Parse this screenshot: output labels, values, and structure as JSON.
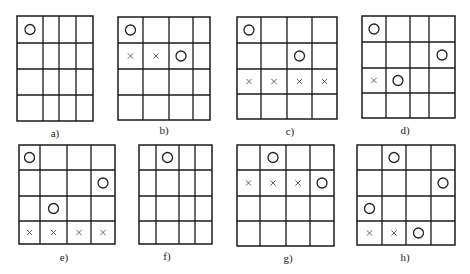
{
  "figure": {
    "background": "#ffffff",
    "line_color": "#1a1a1a",
    "panels": [
      {
        "id": "a",
        "label": "a)",
        "cols": [
          17,
          43,
          59,
          76,
          93
        ],
        "rows": [
          16,
          43,
          69,
          95,
          121
        ],
        "label_pos": [
          55,
          137
        ],
        "marks": [
          {
            "type": "O",
            "row": 0,
            "col": 0
          }
        ]
      },
      {
        "id": "b",
        "label": "b)",
        "cols": [
          118,
          143,
          169,
          193,
          210
        ],
        "rows": [
          17,
          43,
          69,
          95,
          120
        ],
        "label_pos": [
          164,
          134
        ],
        "marks": [
          {
            "type": "O",
            "row": 0,
            "col": 0
          },
          {
            "type": "X",
            "row": 1,
            "col": 0
          },
          {
            "type": "X",
            "row": 1,
            "col": 1
          },
          {
            "type": "O",
            "row": 1,
            "col": 2
          }
        ]
      },
      {
        "id": "c",
        "label": "c)",
        "cols": [
          237,
          261,
          287,
          312,
          337
        ],
        "rows": [
          17,
          43,
          69,
          94,
          119
        ],
        "label_pos": [
          290,
          135
        ],
        "marks": [
          {
            "type": "O",
            "row": 0,
            "col": 0
          },
          {
            "type": "O",
            "row": 1,
            "col": 2
          },
          {
            "type": "X",
            "row": 2,
            "col": 0
          },
          {
            "type": "X",
            "row": 2,
            "col": 1
          },
          {
            "type": "X",
            "row": 2,
            "col": 2
          },
          {
            "type": "X",
            "row": 2,
            "col": 3
          }
        ]
      },
      {
        "id": "d",
        "label": "d)",
        "cols": [
          362,
          386,
          410,
          429,
          455
        ],
        "rows": [
          16,
          42,
          68,
          93,
          118
        ],
        "label_pos": [
          405,
          134
        ],
        "marks": [
          {
            "type": "O",
            "row": 0,
            "col": 0
          },
          {
            "type": "O",
            "row": 1,
            "col": 3
          },
          {
            "type": "X",
            "row": 2,
            "col": 0
          },
          {
            "type": "O",
            "row": 2,
            "col": 1
          }
        ]
      },
      {
        "id": "e",
        "label": "e)",
        "cols": [
          19,
          40,
          67,
          91,
          115
        ],
        "rows": [
          145,
          170,
          196,
          221,
          244
        ],
        "label_pos": [
          64,
          261
        ],
        "marks": [
          {
            "type": "O",
            "row": 0,
            "col": 0
          },
          {
            "type": "O",
            "row": 1,
            "col": 3
          },
          {
            "type": "O",
            "row": 2,
            "col": 1
          },
          {
            "type": "X",
            "row": 3,
            "col": 0
          },
          {
            "type": "X",
            "row": 3,
            "col": 1
          },
          {
            "type": "X",
            "row": 3,
            "col": 2
          },
          {
            "type": "X",
            "row": 3,
            "col": 3
          }
        ]
      },
      {
        "id": "f",
        "label": "f)",
        "cols": [
          139,
          156,
          179,
          195,
          212
        ],
        "rows": [
          145,
          170,
          196,
          221,
          244
        ],
        "label_pos": [
          167,
          260
        ],
        "marks": [
          {
            "type": "O",
            "row": 0,
            "col": 1
          }
        ]
      },
      {
        "id": "g",
        "label": "g)",
        "cols": [
          237,
          260,
          286,
          310,
          334
        ],
        "rows": [
          145,
          170,
          196,
          221,
          246
        ],
        "label_pos": [
          288,
          262
        ],
        "marks": [
          {
            "type": "O",
            "row": 0,
            "col": 1
          },
          {
            "type": "X",
            "row": 1,
            "col": 0
          },
          {
            "type": "X",
            "row": 1,
            "col": 1
          },
          {
            "type": "X",
            "row": 1,
            "col": 2
          },
          {
            "type": "O",
            "row": 1,
            "col": 3
          }
        ]
      },
      {
        "id": "h",
        "label": "h)",
        "cols": [
          357,
          382,
          406,
          431,
          455
        ],
        "rows": [
          145,
          170,
          196,
          221,
          245
        ],
        "label_pos": [
          405,
          261
        ],
        "marks": [
          {
            "type": "O",
            "row": 0,
            "col": 1
          },
          {
            "type": "O",
            "row": 1,
            "col": 3
          },
          {
            "type": "O",
            "row": 2,
            "col": 0
          },
          {
            "type": "X",
            "row": 3,
            "col": 0
          },
          {
            "type": "X",
            "row": 3,
            "col": 1
          },
          {
            "type": "O",
            "row": 3,
            "col": 2
          }
        ]
      }
    ]
  }
}
